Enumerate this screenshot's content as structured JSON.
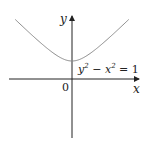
{
  "diagram": {
    "axes": {
      "x_label": "x",
      "y_label": "y",
      "origin_label": "0"
    },
    "equation": {
      "lhs_y": "y",
      "exp1": "2",
      "minus": " − ",
      "lhs_x": "x",
      "exp2": "2",
      "rhs": " = 1"
    },
    "curve_color": "#8a8a8a",
    "axis_color": "#222222"
  }
}
